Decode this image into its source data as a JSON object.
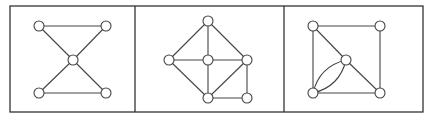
{
  "figure": {
    "colors": {
      "stroke": "#444444",
      "frame": "#333333",
      "node_fill": "#ffffff",
      "background": "#ffffff"
    },
    "frame": {
      "x": 10,
      "y": 6,
      "width": 413,
      "height": 106
    },
    "dividers": [
      135,
      284
    ],
    "node_radius": 5,
    "panels": [
      {
        "name": "bowtie-graph",
        "nodes": [
          {
            "id": "a",
            "x": 39,
            "y": 26
          },
          {
            "id": "b",
            "x": 106,
            "y": 26
          },
          {
            "id": "c",
            "x": 73,
            "y": 60
          },
          {
            "id": "d",
            "x": 39,
            "y": 93
          },
          {
            "id": "e",
            "x": 106,
            "y": 93
          }
        ],
        "edges": [
          {
            "from": "a",
            "to": "b"
          },
          {
            "from": "a",
            "to": "c"
          },
          {
            "from": "b",
            "to": "c"
          },
          {
            "from": "c",
            "to": "d"
          },
          {
            "from": "c",
            "to": "e"
          },
          {
            "from": "d",
            "to": "e"
          }
        ]
      },
      {
        "name": "house-wheel-graph",
        "nodes": [
          {
            "id": "t",
            "x": 208,
            "y": 21
          },
          {
            "id": "l",
            "x": 169,
            "y": 60
          },
          {
            "id": "c",
            "x": 208,
            "y": 60
          },
          {
            "id": "r",
            "x": 247,
            "y": 60
          },
          {
            "id": "b",
            "x": 208,
            "y": 98
          },
          {
            "id": "br",
            "x": 247,
            "y": 98
          }
        ],
        "edges": [
          {
            "from": "t",
            "to": "l"
          },
          {
            "from": "t",
            "to": "c"
          },
          {
            "from": "t",
            "to": "r"
          },
          {
            "from": "l",
            "to": "c"
          },
          {
            "from": "c",
            "to": "r"
          },
          {
            "from": "l",
            "to": "b"
          },
          {
            "from": "c",
            "to": "b"
          },
          {
            "from": "r",
            "to": "b"
          },
          {
            "from": "r",
            "to": "br"
          },
          {
            "from": "b",
            "to": "br"
          }
        ]
      },
      {
        "name": "square-multigraph",
        "nodes": [
          {
            "id": "a",
            "x": 313,
            "y": 26
          },
          {
            "id": "b",
            "x": 380,
            "y": 26
          },
          {
            "id": "c",
            "x": 346,
            "y": 60
          },
          {
            "id": "d",
            "x": 313,
            "y": 93
          },
          {
            "id": "e",
            "x": 380,
            "y": 93
          }
        ],
        "edges": [
          {
            "from": "a",
            "to": "b"
          },
          {
            "from": "a",
            "to": "d"
          },
          {
            "from": "b",
            "to": "e"
          },
          {
            "from": "d",
            "to": "e"
          },
          {
            "from": "a",
            "to": "c"
          },
          {
            "from": "c",
            "to": "e"
          },
          {
            "from": "d",
            "to": "c",
            "curve": 9
          },
          {
            "from": "d",
            "to": "c",
            "curve": -9
          }
        ]
      }
    ]
  }
}
